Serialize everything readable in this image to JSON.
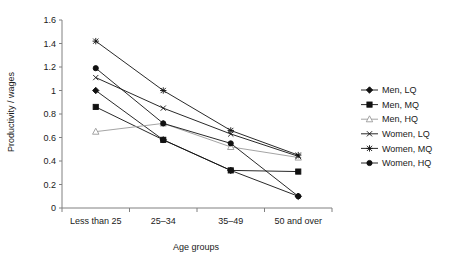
{
  "chart_data": {
    "type": "line",
    "title": "",
    "xlabel": "Age groups",
    "ylabel": "Productivity / wages",
    "categories": [
      "Less than 25",
      "25–34",
      "35–49",
      "50 and over"
    ],
    "ylim": [
      0,
      1.6
    ],
    "ytick_labels": [
      "0",
      "0.2",
      "0.4",
      "0.6",
      "0.8",
      "1",
      "1.2",
      "1.4",
      "1.6"
    ],
    "ytick_values": [
      0,
      0.2,
      0.4,
      0.6,
      0.8,
      1.0,
      1.2,
      1.4,
      1.6
    ],
    "grid": false,
    "legend_position": "right",
    "series": [
      {
        "name": "Men, LQ",
        "marker": "diamond",
        "color": "#111111",
        "values": [
          1.0,
          0.58,
          0.32,
          0.1
        ]
      },
      {
        "name": "Men, MQ",
        "marker": "square",
        "color": "#111111",
        "values": [
          0.86,
          0.58,
          0.32,
          0.31
        ]
      },
      {
        "name": "Men, HQ",
        "marker": "triangle",
        "color": "#9a9a9a",
        "values": [
          0.65,
          0.72,
          0.52,
          0.43
        ]
      },
      {
        "name": "Women, LQ",
        "marker": "cross",
        "color": "#111111",
        "values": [
          1.11,
          0.85,
          0.63,
          0.44
        ]
      },
      {
        "name": "Women, MQ",
        "marker": "star",
        "color": "#111111",
        "values": [
          1.42,
          1.0,
          0.66,
          0.45
        ]
      },
      {
        "name": "Women, HQ",
        "marker": "circle",
        "color": "#111111",
        "values": [
          1.19,
          0.72,
          0.55,
          0.1
        ]
      }
    ]
  },
  "legend": {
    "items": [
      {
        "label": "Men, LQ"
      },
      {
        "label": "Men, MQ"
      },
      {
        "label": "Men, HQ"
      },
      {
        "label": "Women, LQ"
      },
      {
        "label": "Women, MQ"
      },
      {
        "label": "Women, HQ"
      }
    ]
  },
  "axes": {
    "x_title": "Age groups",
    "y_title": "Productivity / wages"
  }
}
